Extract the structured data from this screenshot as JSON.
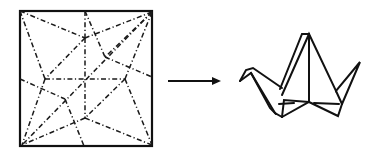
{
  "figure": {
    "line_color": "#111111",
    "background": "#ffffff"
  },
  "crease_pattern": {
    "square": {
      "x": 20,
      "y": 11,
      "width": 132,
      "height": 135
    },
    "fold_lines": [
      [
        [
          20,
          11
        ],
        [
          85,
          38
        ]
      ],
      [
        [
          20,
          11
        ],
        [
          45,
          79
        ]
      ],
      [
        [
          85,
          11
        ],
        [
          85,
          38
        ]
      ],
      [
        [
          85,
          11
        ],
        [
          105,
          57
        ]
      ],
      [
        [
          152,
          12
        ],
        [
          85,
          38
        ]
      ],
      [
        [
          152,
          12
        ],
        [
          105,
          57
        ]
      ],
      [
        [
          152,
          12
        ],
        [
          125,
          79
        ]
      ],
      [
        [
          152,
          12
        ],
        [
          22,
          145
        ]
      ],
      [
        [
          85,
          38
        ],
        [
          85,
          118
        ]
      ],
      [
        [
          85,
          38
        ],
        [
          45,
          79
        ]
      ],
      [
        [
          105,
          57
        ],
        [
          152,
          77
        ]
      ],
      [
        [
          45,
          79
        ],
        [
          125,
          79
        ]
      ],
      [
        [
          20,
          79
        ],
        [
          65,
          99
        ]
      ],
      [
        [
          45,
          79
        ],
        [
          22,
          145
        ]
      ],
      [
        [
          125,
          79
        ],
        [
          85,
          118
        ]
      ],
      [
        [
          125,
          79
        ],
        [
          152,
          145
        ]
      ],
      [
        [
          65,
          99
        ],
        [
          84,
          146
        ]
      ],
      [
        [
          85,
          118
        ],
        [
          22,
          145
        ]
      ],
      [
        [
          85,
          118
        ],
        [
          152,
          145
        ]
      ]
    ]
  },
  "arrow": {
    "x1": 168,
    "y1": 81,
    "x2": 221,
    "y2": 81
  },
  "crane": {
    "paths": [
      "M240,81 L246,70 L253,68 L282,88",
      "M240,81 L251,73 L275,113 L282,117",
      "M251,73 L270,108 L276,114",
      "M280,89 L302,34 L309,34",
      "M282,95 L309,34 L336,91 L360,62 L342,104",
      "M309,34 L309,102",
      "M282,117 L309,102 L338,116 L342,104",
      "M279,104 L294,103",
      "M314,103 L339,104",
      "M282,117 L284,100 L309,102",
      "M336,91 L342,104"
    ]
  }
}
